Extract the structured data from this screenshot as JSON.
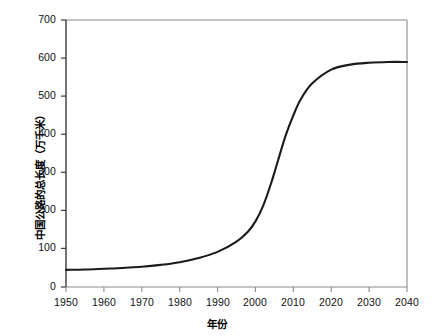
{
  "chart_data": {
    "type": "line",
    "title": "",
    "xlabel": "年份",
    "ylabel": "中国公路的总长度（万千米）",
    "xlim": [
      1950,
      2040
    ],
    "ylim": [
      0,
      700
    ],
    "grid": false,
    "legend": null,
    "xticks": [
      "1950",
      "1960",
      "1970",
      "1980",
      "1990",
      "2000",
      "2010",
      "2020",
      "2030",
      "2040"
    ],
    "yticks": [
      "0",
      "100",
      "200",
      "300",
      "400",
      "500",
      "600",
      "700"
    ],
    "line_color": "#1a1a1a",
    "axis_color": "#808080",
    "series": [
      {
        "name": "中国公路的总长度",
        "x": [
          1950,
          1955,
          1960,
          1965,
          1970,
          1975,
          1980,
          1985,
          1990,
          1995,
          1998,
          2000,
          2002,
          2004,
          2005,
          2006,
          2008,
          2010,
          2012,
          2015,
          2020,
          2025,
          2030,
          2035,
          2040
        ],
        "values": [
          45,
          46,
          48,
          50,
          53,
          58,
          65,
          76,
          92,
          119,
          145,
          172,
          212,
          268,
          300,
          333,
          398,
          450,
          493,
          534,
          570,
          583,
          588,
          590,
          590
        ]
      }
    ]
  }
}
